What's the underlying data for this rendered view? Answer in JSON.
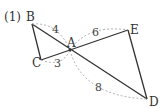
{
  "problem_number": "(1)",
  "points": {
    "A": {
      "label": "A",
      "x": 70,
      "y": 50
    },
    "B": {
      "label": "B",
      "x": 32,
      "y": 24
    },
    "C": {
      "label": "C",
      "x": 41,
      "y": 60
    },
    "D": {
      "label": "D",
      "x": 147,
      "y": 99
    },
    "E": {
      "label": "E",
      "x": 128,
      "y": 30
    }
  },
  "segments": [
    "BC",
    "BD",
    "CE",
    "ED"
  ],
  "measures": {
    "AB": "4",
    "AE": "6",
    "AC": "3",
    "AD": "8"
  },
  "colors": {
    "line": "#333333",
    "dashed": "#9a9a9a"
  }
}
